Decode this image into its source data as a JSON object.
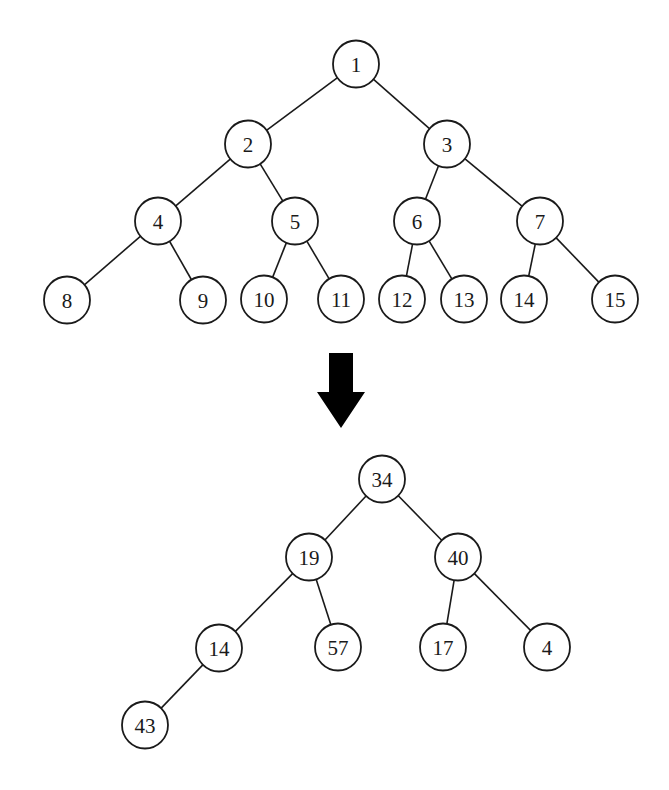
{
  "diagram": {
    "type": "binary-tree-transformation",
    "node_radius": 23,
    "colors": {
      "stroke": "#1a1a1a",
      "fill": "#ffffff",
      "arrow": "#000000"
    },
    "top_tree": {
      "nodes": [
        {
          "id": "t1",
          "label": "1",
          "x": 356,
          "y": 64
        },
        {
          "id": "t2",
          "label": "2",
          "x": 248,
          "y": 144
        },
        {
          "id": "t3",
          "label": "3",
          "x": 447,
          "y": 144
        },
        {
          "id": "t4",
          "label": "4",
          "x": 158,
          "y": 221
        },
        {
          "id": "t5",
          "label": "5",
          "x": 295,
          "y": 221
        },
        {
          "id": "t6",
          "label": "6",
          "x": 417,
          "y": 221
        },
        {
          "id": "t7",
          "label": "7",
          "x": 540,
          "y": 221
        },
        {
          "id": "t8",
          "label": "8",
          "x": 67,
          "y": 300
        },
        {
          "id": "t9",
          "label": "9",
          "x": 203,
          "y": 300
        },
        {
          "id": "t10",
          "label": "10",
          "x": 264,
          "y": 299
        },
        {
          "id": "t11",
          "label": "11",
          "x": 341,
          "y": 299
        },
        {
          "id": "t12",
          "label": "12",
          "x": 402,
          "y": 299
        },
        {
          "id": "t13",
          "label": "13",
          "x": 464,
          "y": 299
        },
        {
          "id": "t14",
          "label": "14",
          "x": 524,
          "y": 299
        },
        {
          "id": "t15",
          "label": "15",
          "x": 615,
          "y": 299
        }
      ],
      "edges": [
        [
          "t1",
          "t2"
        ],
        [
          "t1",
          "t3"
        ],
        [
          "t2",
          "t4"
        ],
        [
          "t2",
          "t5"
        ],
        [
          "t3",
          "t6"
        ],
        [
          "t3",
          "t7"
        ],
        [
          "t4",
          "t8"
        ],
        [
          "t4",
          "t9"
        ],
        [
          "t5",
          "t10"
        ],
        [
          "t5",
          "t11"
        ],
        [
          "t6",
          "t12"
        ],
        [
          "t6",
          "t13"
        ],
        [
          "t7",
          "t14"
        ],
        [
          "t7",
          "t15"
        ]
      ]
    },
    "arrow": {
      "direction": "down",
      "shaft": {
        "x1": 329,
        "x2": 353,
        "top": 353
      },
      "head": {
        "x1": 317,
        "x2": 365,
        "base": 392,
        "tip_x": 341,
        "tip_y": 428
      }
    },
    "bottom_tree": {
      "nodes": [
        {
          "id": "b34",
          "label": "34",
          "x": 382,
          "y": 479
        },
        {
          "id": "b19",
          "label": "19",
          "x": 309,
          "y": 557
        },
        {
          "id": "b40",
          "label": "40",
          "x": 458,
          "y": 557
        },
        {
          "id": "b14",
          "label": "14",
          "x": 219,
          "y": 648
        },
        {
          "id": "b57",
          "label": "57",
          "x": 338,
          "y": 647
        },
        {
          "id": "b17",
          "label": "17",
          "x": 443,
          "y": 647
        },
        {
          "id": "b4",
          "label": "4",
          "x": 547,
          "y": 647
        },
        {
          "id": "b43",
          "label": "43",
          "x": 145,
          "y": 725
        }
      ],
      "edges": [
        [
          "b34",
          "b19"
        ],
        [
          "b34",
          "b40"
        ],
        [
          "b19",
          "b14"
        ],
        [
          "b19",
          "b57"
        ],
        [
          "b40",
          "b17"
        ],
        [
          "b40",
          "b4"
        ],
        [
          "b14",
          "b43"
        ]
      ]
    }
  }
}
